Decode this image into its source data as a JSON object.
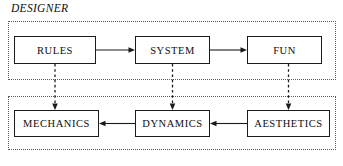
{
  "diagram": {
    "perspective_label": "DESIGNER",
    "containers": [
      {
        "id": "design-layer",
        "name": "designer-layer-container",
        "border_style": "dotted"
      },
      {
        "id": "player-layer",
        "name": "player-layer-container",
        "border_style": "dotted"
      }
    ],
    "top_row": {
      "nodes": [
        {
          "id": "rules",
          "label": "RULES"
        },
        {
          "id": "system",
          "label": "SYSTEM"
        },
        {
          "id": "fun",
          "label": "FUN"
        }
      ],
      "flow_direction": "left-to-right"
    },
    "bottom_row": {
      "nodes": [
        {
          "id": "mechanics",
          "label": "MECHANICS"
        },
        {
          "id": "dynamics",
          "label": "DYNAMICS"
        },
        {
          "id": "aesthetics",
          "label": "AESTHETICS"
        }
      ],
      "flow_direction": "right-to-left"
    },
    "connectors": [
      {
        "id": "rules-to-system",
        "from": "RULES",
        "to": "SYSTEM",
        "style": "solid",
        "arrow": "end"
      },
      {
        "id": "system-to-fun",
        "from": "SYSTEM",
        "to": "FUN",
        "style": "solid",
        "arrow": "end"
      },
      {
        "id": "dynamics-to-mechanics",
        "from": "DYNAMICS",
        "to": "MECHANICS",
        "style": "solid",
        "arrow": "end"
      },
      {
        "id": "aesthetics-to-dynamics",
        "from": "AESTHETICS",
        "to": "DYNAMICS",
        "style": "solid",
        "arrow": "end"
      },
      {
        "id": "rules-to-mechanics",
        "from": "RULES",
        "to": "MECHANICS",
        "style": "dashed",
        "arrow": "end"
      },
      {
        "id": "system-to-dynamics",
        "from": "SYSTEM",
        "to": "DYNAMICS",
        "style": "dashed",
        "arrow": "end"
      },
      {
        "id": "fun-to-aesthetics",
        "from": "FUN",
        "to": "AESTHETICS",
        "style": "dashed",
        "arrow": "end"
      }
    ],
    "colors": {
      "stroke": "#1a1a1a",
      "container_border": "#5a5a5a",
      "background": "#ffffff",
      "text": "#0d0d0d"
    }
  }
}
